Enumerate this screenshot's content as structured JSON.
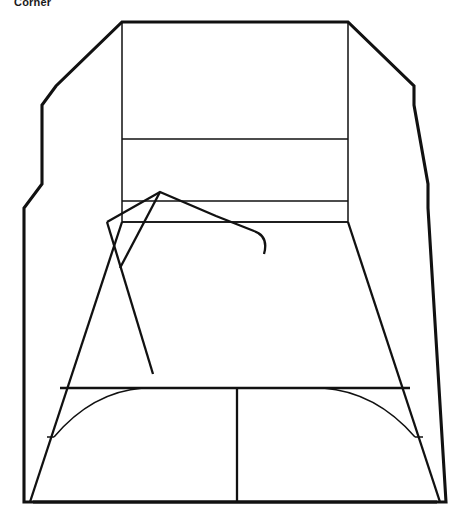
{
  "caption": {
    "text": "Corner"
  },
  "palette": {
    "background": "#ffffff",
    "ink": "#111111"
  },
  "figure": {
    "title": "Corner",
    "type": "line-drawing",
    "canvas": {
      "width": 470,
      "height": 522
    },
    "paths": {
      "outer_silhouette": "M 24 502 L 24 208 L 42 184 L 42 105 L 56 86 L 122 22 L 348 22 L 414 86 L 414 105 L 428 184 L 428 208 L 446 502 Z",
      "back_wall_rect": "M 122 22 L 348 22 L 348 222 L 122 222 Z",
      "band_line_upper": "M 122 139 L 348 139",
      "band_line_lower_top": "M 122 201 L 348 201",
      "band_line_lower_bottom": "M 122 222 L 348 222",
      "floor_left_edge": "M 122 222 L 30 502",
      "floor_right_edge": "M 348 222 L 440 502",
      "floor_band_top": "M 60 388 L 410 388",
      "floor_band_bottom": "M 33 502 L 437 502",
      "floor_divider": "M 237 388 L 237 502",
      "arc_left": "M 143 388 Q 92 392 54 437",
      "arc_right": "M 323 388 Q 376 392 415 437",
      "base_left_tick": "M 54 437 L 47 437",
      "base_right_tick": "M 415 437 L 423 437",
      "scribble_main": "M 107 222 L 160 192 L 216 216 L 254 231 Q 269 236 264 254",
      "scribble_tail": "M 107 222 L 153 374",
      "scribble_cross": "M 160 192 L 120 268"
    },
    "vertices": {
      "top_left_corner": [
        122,
        22
      ],
      "top_right_corner": [
        348,
        22
      ],
      "bottom_left_corner": [
        33,
        502
      ],
      "bottom_right_corner": [
        437,
        502
      ],
      "scribble_peak": [
        160,
        192
      ],
      "floor_divider_x": 237
    }
  }
}
